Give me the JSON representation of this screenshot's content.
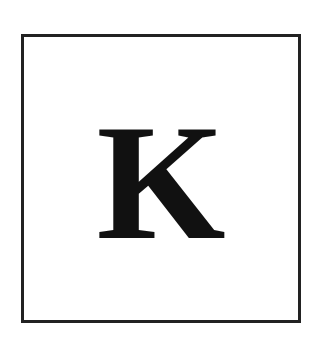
{
  "card": {
    "letter": "K",
    "border_color": "#222222",
    "letter_color": "#111111",
    "background": "#ffffff"
  }
}
